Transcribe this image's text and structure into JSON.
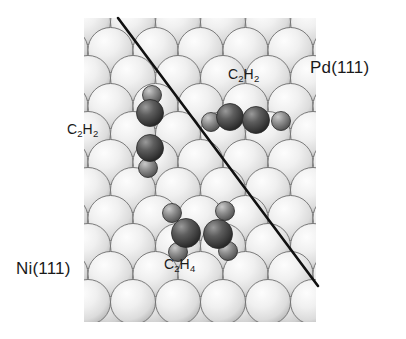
{
  "figure": {
    "background_color": "#ffffff"
  },
  "labels": {
    "surface_left": {
      "text": "Ni(111)",
      "element": "Ni",
      "facet": "(111)"
    },
    "surface_right": {
      "text": "Pd(111)",
      "element": "Pd",
      "facet": "(111)"
    },
    "molecule_upper_right": {
      "formula": "C",
      "sub1": "2",
      "mid": "H",
      "sub2": "2"
    },
    "molecule_left": {
      "formula": "C",
      "sub1": "2",
      "mid": "H",
      "sub2": "2"
    },
    "molecule_bottom": {
      "formula": "C",
      "sub1": "2",
      "mid": "H",
      "sub2": "4"
    }
  },
  "colors": {
    "substrate_sphere_light": "#efefef",
    "substrate_sphere_mid": "#d8d8d8",
    "substrate_sphere_shadow": "#a8a8a8",
    "substrate_outline": "#6e6e6e",
    "sublayer_sphere": "#c9c9c9",
    "carbon_atom_dark": "#3c3c3c",
    "carbon_atom_mid": "#6a6a6a",
    "hydrogen_atom": "#8a8a8a",
    "atom_outline": "#2a2a2a",
    "divider_line": "#111111",
    "text": "#1a1a1a"
  },
  "divider": {
    "name": "domain-boundary-line",
    "x1": 118,
    "y1": 18,
    "x2": 318,
    "y2": 286,
    "stroke_width": 2.6
  },
  "lattice": {
    "left": 88,
    "right": 311,
    "top": 22,
    "bottom": 319,
    "radius": 22.5,
    "row_spacing": 28,
    "col_spacing": 45,
    "rows": 11,
    "cols": 5
  },
  "molecules": [
    {
      "name": "acetylene-left-vertical",
      "label": "C2H2",
      "orientation": "vertical",
      "atoms": [
        {
          "kind": "H",
          "cx": 152,
          "cy": 95,
          "r": 9.5
        },
        {
          "kind": "C",
          "cx": 150,
          "cy": 113,
          "r": 13.5
        },
        {
          "kind": "C",
          "cx": 150,
          "cy": 148,
          "r": 13.5
        },
        {
          "kind": "H",
          "cx": 148,
          "cy": 168,
          "r": 9.5
        }
      ]
    },
    {
      "name": "acetylene-right-horizontal",
      "label": "C2H2",
      "orientation": "horizontal",
      "atoms": [
        {
          "kind": "H",
          "cx": 211,
          "cy": 122,
          "r": 9.5
        },
        {
          "kind": "C",
          "cx": 230,
          "cy": 117,
          "r": 13.5
        },
        {
          "kind": "C",
          "cx": 256,
          "cy": 120,
          "r": 13.5
        },
        {
          "kind": "H",
          "cx": 281,
          "cy": 121,
          "r": 9.5
        }
      ]
    },
    {
      "name": "ethylene-bottom",
      "label": "C2H4",
      "orientation": "horizontal",
      "atoms": [
        {
          "kind": "H",
          "cx": 172,
          "cy": 213,
          "r": 9.5
        },
        {
          "kind": "H",
          "cx": 225,
          "cy": 211,
          "r": 9.5
        },
        {
          "kind": "C",
          "cx": 186,
          "cy": 233,
          "r": 14.5
        },
        {
          "kind": "C",
          "cx": 218,
          "cy": 234,
          "r": 14.5
        },
        {
          "kind": "H",
          "cx": 178,
          "cy": 252,
          "r": 9.5
        },
        {
          "kind": "H",
          "cx": 228,
          "cy": 251,
          "r": 9.5
        }
      ]
    }
  ]
}
